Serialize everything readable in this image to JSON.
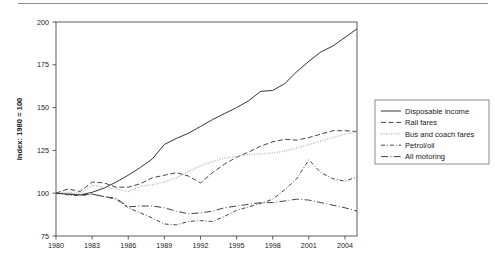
{
  "figure": {
    "background_color": "#ffffff",
    "top_rule_color": "#8d8d91",
    "axis_color": "#4a4a4a"
  },
  "chart_data": {
    "type": "line",
    "title": "",
    "xlabel": "",
    "ylabel": "Index: 1980 = 100",
    "xlim": [
      1980,
      2005
    ],
    "ylim": [
      75,
      200
    ],
    "ytick_labels": [
      "75",
      "100",
      "125",
      "150",
      "175",
      "200"
    ],
    "yticks": [
      75,
      100,
      125,
      150,
      175,
      200
    ],
    "xtick_labels": [
      "1980",
      "1983",
      "1986",
      "1989",
      "1992",
      "1995",
      "1998",
      "2001",
      "2004"
    ],
    "xticks": [
      1980,
      1983,
      1986,
      1989,
      1992,
      1995,
      1998,
      2001,
      2004
    ],
    "grid": false,
    "legend_position": "right-outside",
    "x": [
      1980,
      1981,
      1982,
      1983,
      1984,
      1985,
      1986,
      1987,
      1988,
      1989,
      1990,
      1991,
      1992,
      1993,
      1994,
      1995,
      1996,
      1997,
      1998,
      1999,
      2000,
      2001,
      2002,
      2003,
      2004,
      2005
    ],
    "series": [
      {
        "name": "Disposable income",
        "style": "solid",
        "color": "#2b2b2b",
        "values": [
          100,
          99.5,
          99.0,
          100.5,
          103.0,
          106.5,
          110.5,
          115.0,
          120.0,
          128.5,
          132.0,
          135.0,
          139.0,
          143.0,
          146.5,
          150.0,
          154.0,
          159.5,
          160.0,
          164.0,
          171.0,
          177.0,
          182.5,
          186.0,
          191.0,
          196.0
        ]
      },
      {
        "name": "Rail fares",
        "style": "dashed",
        "color": "#3a3a3a",
        "values": [
          100,
          102.5,
          101.0,
          106.5,
          106.0,
          103.5,
          103.5,
          105.5,
          109.0,
          110.5,
          112.0,
          110.0,
          106.0,
          112.0,
          117.0,
          121.0,
          124.0,
          127.5,
          130.0,
          131.5,
          131.0,
          132.5,
          134.5,
          136.5,
          136.5,
          136.0
        ]
      },
      {
        "name": "Bus and coach fares",
        "style": "dotted",
        "color": "#b9b9bd",
        "values": [
          100,
          100.5,
          100.0,
          104.5,
          103.5,
          102.5,
          101.0,
          104.0,
          105.0,
          106.5,
          109.0,
          112.5,
          116.0,
          118.5,
          120.5,
          121.5,
          122.5,
          123.0,
          123.5,
          124.5,
          126.5,
          128.5,
          130.5,
          132.5,
          134.5,
          136.0
        ]
      },
      {
        "name": "Petrol/oil",
        "style": "dashdot-short",
        "color": "#3a3a3a",
        "values": [
          100,
          99.0,
          98.5,
          99.5,
          98.0,
          96.5,
          91.5,
          88.5,
          85.5,
          82.0,
          81.5,
          83.5,
          84.0,
          83.5,
          86.5,
          90.0,
          92.0,
          94.0,
          96.5,
          102.0,
          108.5,
          119.5,
          112.0,
          108.5,
          107.0,
          109.5
        ]
      },
      {
        "name": "All motoring",
        "style": "dashdot-long",
        "color": "#3a3a3a",
        "values": [
          100,
          99.5,
          99.0,
          99.5,
          98.0,
          97.0,
          92.0,
          92.5,
          92.5,
          91.5,
          89.5,
          88.0,
          88.5,
          89.5,
          91.5,
          92.5,
          93.5,
          94.5,
          94.5,
          95.5,
          96.5,
          96.0,
          94.5,
          93.0,
          91.5,
          89.5
        ]
      }
    ]
  }
}
